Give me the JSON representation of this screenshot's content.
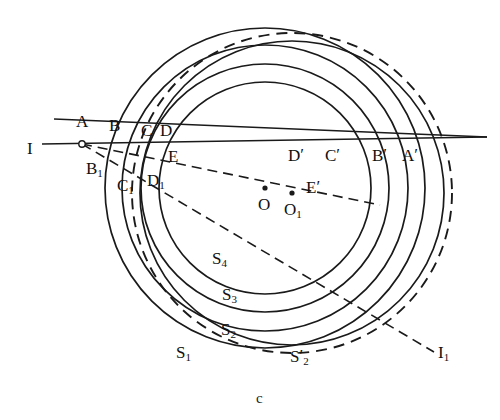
{
  "figure": {
    "caption": "c",
    "caption_pos": {
      "x": 256,
      "y": 390
    },
    "background": "#ffffff",
    "stroke": "#1a1a1a"
  },
  "centers": [
    {
      "name": "O",
      "label": "O",
      "cx": 265,
      "cy": 188,
      "label_x": 258,
      "label_y": 196
    },
    {
      "name": "O1",
      "label": "O",
      "sub": "1",
      "cx": 292,
      "cy": 193,
      "label_x": 284,
      "label_y": 201
    }
  ],
  "circles": [
    {
      "name": "S1",
      "center": "O",
      "r": 160,
      "style": "solid",
      "label": "S",
      "sub": "1",
      "label_x": 176,
      "label_y": 344
    },
    {
      "name": "S2",
      "center": "O",
      "r": 143,
      "style": "solid",
      "label": "S",
      "sub": "2",
      "label_x": 221,
      "label_y": 321
    },
    {
      "name": "S3",
      "center": "O",
      "r": 124,
      "style": "solid",
      "label": "S",
      "sub": "3",
      "label_x": 222,
      "label_y": 286
    },
    {
      "name": "S4",
      "center": "O",
      "r": 106,
      "style": "solid",
      "label": "S",
      "sub": "4",
      "label_x": 212,
      "label_y": 250
    },
    {
      "name": "S1b",
      "center": "O1",
      "r": 152,
      "style": "solid",
      "label": "",
      "sub": "",
      "label_x": 0,
      "label_y": 0
    },
    {
      "name": "S2p",
      "center": "O1",
      "r": 160,
      "style": "dashed",
      "label": "S",
      "sub": "2",
      "prime": "′",
      "label_x": 290,
      "label_y": 348
    }
  ],
  "lines": [
    {
      "name": "line-I",
      "label": "I",
      "style": "solid",
      "x1": 42,
      "y1": 144,
      "x2": 487,
      "y2": 137,
      "label_x": 27,
      "label_y": 140
    },
    {
      "name": "line-slant-top",
      "label": "",
      "style": "solid",
      "x1": 54,
      "y1": 119,
      "x2": 487,
      "y2": 137
    },
    {
      "name": "line-I1",
      "label": "I",
      "sub": "1",
      "style": "dashed",
      "x1": 82,
      "y1": 144,
      "x2": 434,
      "y2": 352,
      "label_x": 438,
      "label_y": 344
    },
    {
      "name": "line-OO1-Eprime",
      "label": "",
      "style": "dashed",
      "x1": 82,
      "y1": 144,
      "x2": 380,
      "y2": 205
    }
  ],
  "vertex": {
    "name": "I-convergence-point",
    "x": 82,
    "y": 144
  },
  "points": [
    {
      "name": "A",
      "label": "A",
      "x": 76,
      "y": 113
    },
    {
      "name": "B",
      "label": "B",
      "x": 109,
      "y": 117
    },
    {
      "name": "C",
      "label": "C",
      "x": 141,
      "y": 122
    },
    {
      "name": "D",
      "label": "D",
      "x": 160,
      "y": 122
    },
    {
      "name": "E",
      "label": "E",
      "x": 168,
      "y": 148
    },
    {
      "name": "B1",
      "label": "B",
      "sub": "1",
      "x": 86,
      "y": 160
    },
    {
      "name": "C1",
      "label": "C",
      "sub": "1",
      "x": 117,
      "y": 177
    },
    {
      "name": "D1",
      "label": "D",
      "sub": "1",
      "x": 147,
      "y": 172
    },
    {
      "name": "Dp",
      "label": "D",
      "prime": "′",
      "x": 288,
      "y": 147
    },
    {
      "name": "Cp",
      "label": "C",
      "prime": "′",
      "x": 325,
      "y": 147
    },
    {
      "name": "Bp",
      "label": "B",
      "prime": "′",
      "x": 372,
      "y": 147
    },
    {
      "name": "Ap",
      "label": "A",
      "prime": "′",
      "x": 402,
      "y": 147
    },
    {
      "name": "Ep",
      "label": "E",
      "prime": "′",
      "x": 306,
      "y": 179
    }
  ]
}
